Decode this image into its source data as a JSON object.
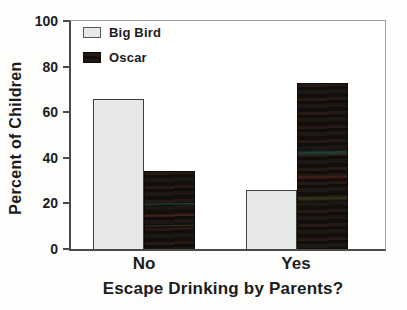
{
  "chart_data": {
    "type": "bar",
    "title": "",
    "categories": [
      "No",
      "Yes"
    ],
    "series": [
      {
        "name": "Big Bird",
        "values": [
          66,
          26
        ],
        "color": "#e7e9e9"
      },
      {
        "name": "Oscar",
        "values": [
          34,
          73
        ],
        "color": "#191210"
      }
    ],
    "xlabel": "Escape Drinking by Parents?",
    "ylabel": "Percent of Children",
    "ylim": [
      0,
      100
    ],
    "yticks": [
      0,
      20,
      40,
      60,
      80,
      100
    ],
    "grid": false,
    "legend": {
      "position": "top-left-inside",
      "entries": [
        "Big Bird",
        "Oscar"
      ]
    },
    "colors": {
      "axis_dark": "#4a4a4a",
      "axis_light": "#9c9c9c",
      "text": "#1c1c1e",
      "background": "#fdfdfc"
    }
  }
}
